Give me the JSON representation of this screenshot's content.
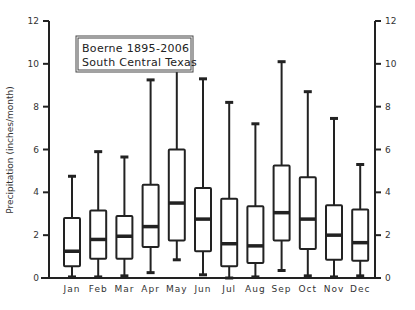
{
  "chart_data": {
    "type": "box",
    "title": "Boerne 1895-2006",
    "subtitle": "South Central Texas",
    "xlabel": "",
    "ylabel": "Precipitation (inches/month)",
    "ylim": [
      0,
      12
    ],
    "yticks": [
      0,
      2,
      4,
      6,
      8,
      10,
      12
    ],
    "y_axis_right_mirror": true,
    "grid": false,
    "legend": null,
    "categories": [
      "Jan",
      "Feb",
      "Mar",
      "Apr",
      "May",
      "Jun",
      "Jul",
      "Aug",
      "Sep",
      "Oct",
      "Nov",
      "Dec"
    ],
    "series": [
      {
        "name": "min",
        "values": [
          0.05,
          0.05,
          0.1,
          0.25,
          0.85,
          0.15,
          0.0,
          0.05,
          0.35,
          0.1,
          0.05,
          0.1
        ]
      },
      {
        "name": "q1",
        "values": [
          0.55,
          0.9,
          0.9,
          1.45,
          1.75,
          1.25,
          0.55,
          0.7,
          1.75,
          1.35,
          0.85,
          0.8
        ]
      },
      {
        "name": "median",
        "values": [
          1.25,
          1.8,
          1.95,
          2.4,
          3.5,
          2.75,
          1.6,
          1.5,
          3.05,
          2.75,
          2.0,
          1.65
        ]
      },
      {
        "name": "q3",
        "values": [
          2.8,
          3.15,
          2.9,
          4.35,
          6.0,
          4.2,
          3.7,
          3.35,
          5.25,
          4.7,
          3.4,
          3.2
        ]
      },
      {
        "name": "max",
        "values": [
          4.75,
          5.9,
          5.65,
          9.25,
          10.8,
          9.3,
          8.2,
          7.2,
          10.1,
          8.7,
          7.45,
          5.3
        ]
      }
    ]
  },
  "labels": {
    "title_line1": "Boerne 1895-2006",
    "title_line2": "South Central Texas",
    "ylabel": "Precipitation (inches/month)"
  }
}
